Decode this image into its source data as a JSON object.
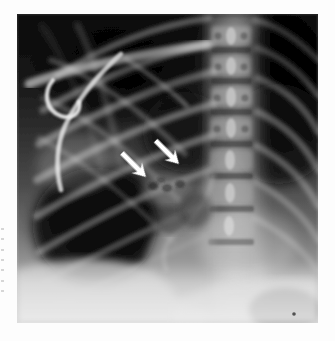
{
  "figure": {
    "kind": "medical-radiograph",
    "modality": "chest-x-ray",
    "view": "anteroposterior",
    "page_background": "#ffffff",
    "plate": {
      "x": 17,
      "y": 14,
      "width": 301,
      "height": 309,
      "corner_dot_visible": true
    }
  },
  "tones": {
    "lung_dark": "#0c0c0c",
    "lung_mid_dark": "#2a2a2a",
    "soft_tissue_mid": "#7a7a7a",
    "soft_tissue_light": "#b4b4b4",
    "bone_bright": "#d8d8d8",
    "bone_brightest": "#f0f0f0",
    "abdomen_light": "#cfcfcf",
    "page_white": "#ffffff",
    "arrow_white": "#ffffff"
  },
  "annotations": {
    "arrows": [
      {
        "id": "arrow-left",
        "label": "left-pointing-arrow",
        "tip_x": 129,
        "tip_y": 163,
        "tail_x": 160,
        "tail_y": 132,
        "direction_degrees": 225,
        "color": "#ffffff"
      },
      {
        "id": "arrow-right",
        "label": "right-pointing-arrow",
        "tip_x": 162,
        "tip_y": 150,
        "tail_x": 192,
        "tail_y": 120,
        "direction_degrees": 225,
        "color": "#ffffff"
      }
    ],
    "edge_fragments": {
      "description": "faint cropped glyph fragments at left page margin",
      "count": 7
    }
  },
  "anatomy": {
    "structures": [
      "thoracic-vertebrae",
      "spinous-processes",
      "posterior-ribs",
      "anterior-ribs",
      "right-clavicle",
      "scapula-edge",
      "cardiac-silhouette",
      "right-hemidiaphragm",
      "left-hemidiaphragm",
      "hilar-region",
      "gastric-air-bubble",
      "support-tube-loop"
    ]
  }
}
